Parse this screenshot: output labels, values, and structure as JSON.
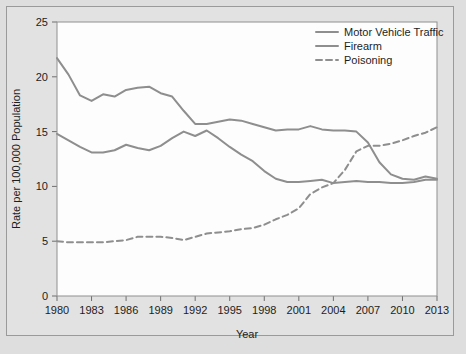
{
  "chart_data": {
    "type": "line",
    "title": "",
    "xlabel": "Year",
    "ylabel": "Rate per 100,000 Population",
    "xlim": [
      1980,
      2013
    ],
    "ylim": [
      0,
      25
    ],
    "grid": false,
    "legend_position": "top-right",
    "xticks": [
      1980,
      1983,
      1986,
      1989,
      1992,
      1995,
      1998,
      2001,
      2004,
      2007,
      2010,
      2013
    ],
    "xtick_labels": [
      "1980",
      "1983",
      "1986",
      "1989",
      "1992",
      "1995",
      "1998",
      "2001",
      "2004",
      "2007",
      "2010",
      "2013"
    ],
    "yticks": [
      0,
      5,
      10,
      15,
      20,
      25
    ],
    "ytick_labels": [
      "0",
      "5",
      "10",
      "15",
      "20",
      "25"
    ],
    "x": [
      1980,
      1981,
      1982,
      1983,
      1984,
      1985,
      1986,
      1987,
      1988,
      1989,
      1990,
      1991,
      1992,
      1993,
      1994,
      1995,
      1996,
      1997,
      1998,
      1999,
      2000,
      2001,
      2002,
      2003,
      2004,
      2005,
      2006,
      2007,
      2008,
      2009,
      2010,
      2011,
      2012,
      2013
    ],
    "series": [
      {
        "name": "Motor Vehicle Traffic",
        "style": "solid",
        "color": "#8e8e8e",
        "values": [
          21.7,
          20.2,
          18.3,
          17.8,
          18.4,
          18.2,
          18.8,
          19.0,
          19.1,
          18.5,
          18.2,
          16.9,
          15.7,
          15.7,
          15.9,
          16.1,
          16.0,
          15.7,
          15.4,
          15.1,
          15.2,
          15.2,
          15.5,
          15.2,
          15.1,
          15.1,
          15.0,
          14.0,
          12.2,
          11.1,
          10.7,
          10.6,
          10.9,
          10.7
        ]
      },
      {
        "name": "Firearm",
        "style": "solid",
        "color": "#8e8e8e",
        "values": [
          14.8,
          14.2,
          13.6,
          13.1,
          13.1,
          13.3,
          13.8,
          13.5,
          13.3,
          13.7,
          14.4,
          15.0,
          14.6,
          15.1,
          14.4,
          13.6,
          12.9,
          12.3,
          11.4,
          10.7,
          10.4,
          10.4,
          10.5,
          10.6,
          10.3,
          10.4,
          10.5,
          10.4,
          10.4,
          10.3,
          10.3,
          10.4,
          10.6,
          10.6
        ]
      },
      {
        "name": "Poisoning",
        "style": "dashed",
        "color": "#8e8e8e",
        "values": [
          5.0,
          4.9,
          4.9,
          4.9,
          4.9,
          5.0,
          5.1,
          5.4,
          5.4,
          5.4,
          5.3,
          5.1,
          5.4,
          5.7,
          5.8,
          5.9,
          6.1,
          6.2,
          6.5,
          7.0,
          7.4,
          8.0,
          9.3,
          9.9,
          10.3,
          11.5,
          13.2,
          13.7,
          13.7,
          13.9,
          14.2,
          14.6,
          14.9,
          15.4
        ]
      }
    ],
    "legend_entries": [
      "Motor Vehicle Traffic",
      "Firearm",
      "Poisoning"
    ]
  },
  "colors": {
    "line": "#8e8e8e",
    "axis": "#8f8f8f",
    "text": "#1d1d1d",
    "plot_background": "#fdfdfd",
    "figure_background": "#e2e2e2",
    "page_background": "#dedede"
  }
}
